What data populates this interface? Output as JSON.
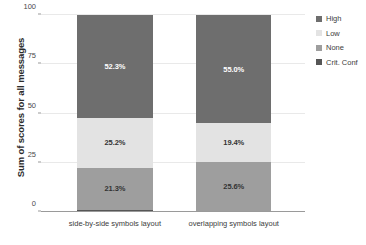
{
  "chart_data": {
    "type": "bar",
    "subtype": "stacked-100-percent",
    "title": "",
    "xlabel": "",
    "ylabel": "Sum of scores for all messages",
    "ylim": [
      0,
      100
    ],
    "yticks": [
      0,
      25,
      50,
      75,
      100
    ],
    "grid": true,
    "legend_position": "right",
    "categories": [
      "side-by-side symbols layout",
      "overlapping symbols layout"
    ],
    "series": [
      {
        "name": "High",
        "color": "#6e6e6e",
        "values": [
          52.3,
          55.0
        ],
        "labels": [
          "52.3%",
          "55.0%"
        ],
        "label_color": "#ffffff"
      },
      {
        "name": "Low",
        "color": "#e3e3e3",
        "values": [
          25.2,
          19.4
        ],
        "labels": [
          "25.2%",
          "19.4%"
        ],
        "label_color": "#333333"
      },
      {
        "name": "None",
        "color": "#9e9e9e",
        "values": [
          21.3,
          25.6
        ],
        "labels": [
          "21.3%",
          "25.6%"
        ],
        "label_color": "#333333"
      },
      {
        "name": "Crit. Conf",
        "color": "#565656",
        "values": [
          1.2,
          0.0
        ],
        "labels": [
          "",
          ""
        ],
        "label_color": "#ffffff"
      }
    ]
  },
  "axis": {
    "y_title": "Sum of scores for all messages",
    "y_tick_labels": [
      "0",
      "25",
      "50",
      "75",
      "100"
    ]
  },
  "legend": {
    "items": [
      {
        "label": "High",
        "color": "#6e6e6e"
      },
      {
        "label": "Low",
        "color": "#e3e3e3"
      },
      {
        "label": "None",
        "color": "#9e9e9e"
      },
      {
        "label": "Crit. Conf",
        "color": "#565656"
      }
    ]
  },
  "colors": {
    "background": "#ffffff",
    "gridline": "#e9e9e9",
    "axis": "#9a9a9a",
    "text": "#3c3c3c"
  }
}
